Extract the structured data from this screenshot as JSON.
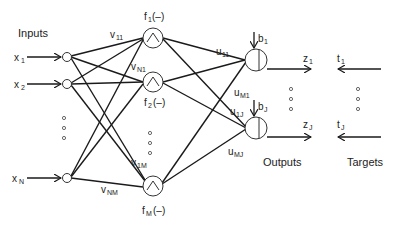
{
  "diagram": {
    "type": "neural-network",
    "labels": {
      "inputs": "Inputs",
      "outputs": "Outputs",
      "targets": "Targets"
    },
    "inputs": [
      {
        "label": "x",
        "sub": "1",
        "y": 57
      },
      {
        "label": "x",
        "sub": "2",
        "y": 84
      },
      {
        "label": "x",
        "sub": "N",
        "y": 178
      }
    ],
    "hidden": [
      {
        "label": "f",
        "sub": "1",
        "suffix": "(–)",
        "y": 38,
        "label_pos": "above"
      },
      {
        "label": "f",
        "sub": "2",
        "suffix": "(–)",
        "y": 82,
        "label_pos": "below"
      },
      {
        "label": "f",
        "sub": "M",
        "suffix": "(–)",
        "y": 186,
        "label_pos": "below"
      }
    ],
    "outputs": [
      {
        "bias": "b",
        "bias_sub": "1",
        "z": "z",
        "z_sub": "1",
        "t": "t",
        "t_sub": "1",
        "y": 60
      },
      {
        "bias": "b",
        "bias_sub": "J",
        "z": "z",
        "z_sub": "J",
        "t": "t",
        "t_sub": "J",
        "y": 128
      }
    ],
    "weights_v": [
      {
        "label": "v",
        "sub": "11"
      },
      {
        "label": "v",
        "sub": "N1"
      },
      {
        "label": "v",
        "sub": "1M"
      },
      {
        "label": "v",
        "sub": "NM"
      }
    ],
    "weights_u": [
      {
        "label": "u",
        "sub": "11"
      },
      {
        "label": "u",
        "sub": "M1"
      },
      {
        "label": "u",
        "sub": "1J"
      },
      {
        "label": "u",
        "sub": "MJ"
      }
    ],
    "ellipsis": "⋮"
  }
}
